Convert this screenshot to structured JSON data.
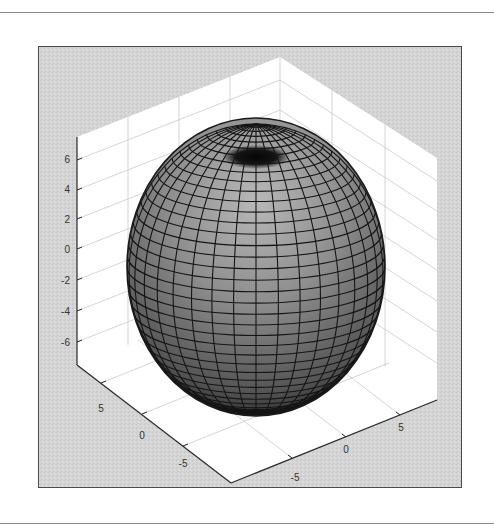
{
  "chart_data": {
    "type": "surface3d",
    "title": "",
    "surface": {
      "shape": "ellipsoid",
      "center": [
        0,
        0,
        0
      ],
      "radii": [
        7,
        7,
        8
      ],
      "meridians": 36,
      "parallels": 40,
      "face_color": "#8c8c8c",
      "edge_color": "#111111"
    },
    "axes": {
      "x": {
        "label": "",
        "ticks": [
          -5,
          0,
          5
        ],
        "tick_labels": [
          "-5",
          "0",
          "5"
        ],
        "lim": [
          -8,
          8
        ]
      },
      "y": {
        "label": "",
        "ticks": [
          -5,
          0,
          5
        ],
        "tick_labels": [
          "-5",
          "0",
          "5"
        ],
        "lim": [
          -8,
          8
        ]
      },
      "z": {
        "label": "",
        "ticks": [
          -6,
          -4,
          -2,
          0,
          2,
          4,
          6
        ],
        "tick_labels": [
          "-6",
          "-4",
          "-2",
          "0",
          "2",
          "4",
          "6"
        ],
        "lim": [
          -8,
          8
        ]
      }
    },
    "grid": true,
    "view": "3D isometric (default MATLAB view)",
    "background": "#d6d6d6",
    "walls_color": "#ffffff",
    "legend": null
  },
  "labels": {
    "z_ticks": [
      "6",
      "4",
      "2",
      "0",
      "-2",
      "-4",
      "-6"
    ],
    "left_ticks": [
      "5",
      "0",
      "-5"
    ],
    "right_ticks": [
      "-5",
      "0",
      "5"
    ]
  }
}
